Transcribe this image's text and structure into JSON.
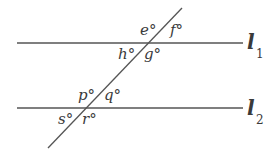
{
  "diagram": {
    "type": "parallel-lines-transversal",
    "colors": {
      "line": "#555555",
      "text": "#3a3a3a",
      "background": "#ffffff"
    },
    "lines": [
      {
        "name": "l1",
        "label": "l",
        "subscript": "1"
      },
      {
        "name": "l2",
        "label": "l",
        "subscript": "2"
      }
    ],
    "angles": {
      "e": "e°",
      "f": "f°",
      "g": "g°",
      "h": "h°",
      "p": "p°",
      "q": "q°",
      "r": "r°",
      "s": "s°"
    }
  }
}
